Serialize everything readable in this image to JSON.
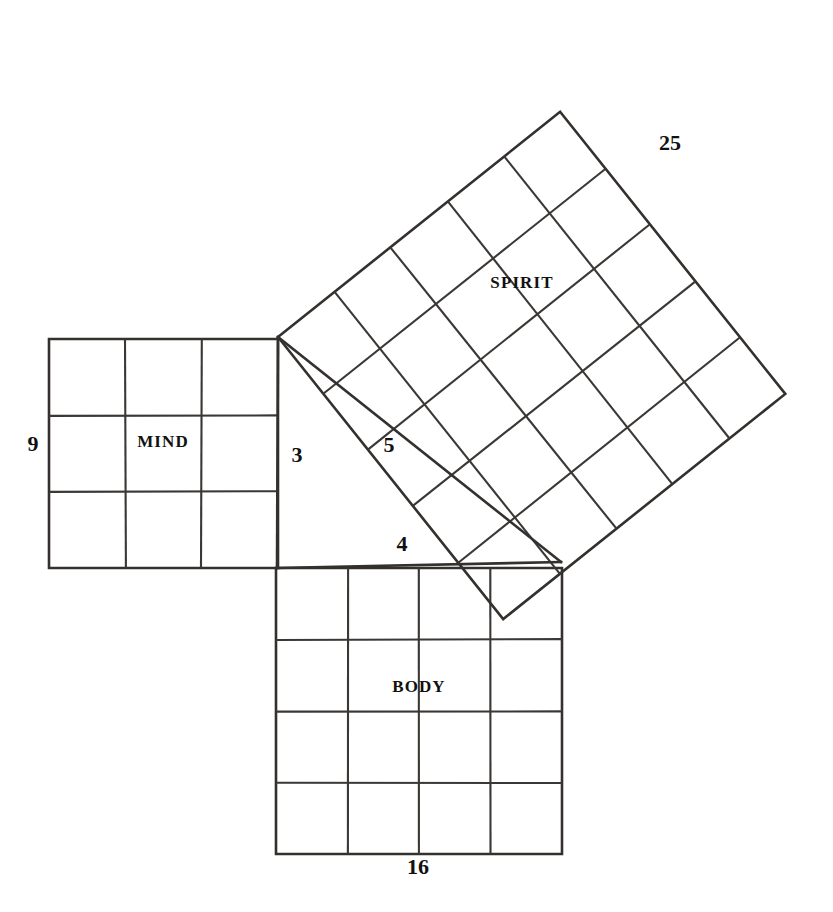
{
  "figure": {
    "background_color": "#ffffff",
    "ink_color": "#33302e",
    "label_color": "#111111"
  },
  "squares": [
    {
      "id": "mind",
      "name": "MIND",
      "grid": 3,
      "side_value": "3",
      "area_value": "9",
      "rotation_deg": 0,
      "origin": {
        "x": 49,
        "y": 339
      },
      "size": 229
    },
    {
      "id": "body",
      "name": "BODY",
      "grid": 4,
      "side_value": "4",
      "area_value": "16",
      "rotation_deg": 0,
      "origin": {
        "x": 276,
        "y": 568
      },
      "size": 286
    },
    {
      "id": "spirit",
      "name": "SPIRIT",
      "grid": 5,
      "side_value": "5",
      "area_value": "25",
      "rotation_deg": -38.6,
      "origin": {
        "x": 278,
        "y": 337
      },
      "size": 361
    }
  ],
  "triangle": {
    "vertex_top": {
      "x": 278,
      "y": 337
    },
    "vertex_right_angle": {
      "x": 277,
      "y": 568
    },
    "vertex_right": {
      "x": 561,
      "y": 562
    }
  },
  "labels": {
    "mind_area": {
      "text": "9",
      "x": 33,
      "y": 451
    },
    "mind_side": {
      "text": "3",
      "x": 297,
      "y": 462
    },
    "mind_name": {
      "text": "MIND",
      "x": 163,
      "y": 447
    },
    "body_side": {
      "text": "4",
      "x": 402,
      "y": 551
    },
    "body_area": {
      "text": "16",
      "x": 418,
      "y": 874
    },
    "body_name": {
      "text": "BODY",
      "x": 419,
      "y": 692
    },
    "spirit_side": {
      "text": "5",
      "x": 389,
      "y": 452
    },
    "spirit_area": {
      "text": "25",
      "x": 670,
      "y": 150
    },
    "spirit_name": {
      "text": "SPIRIT",
      "x": 522,
      "y": 288
    }
  }
}
